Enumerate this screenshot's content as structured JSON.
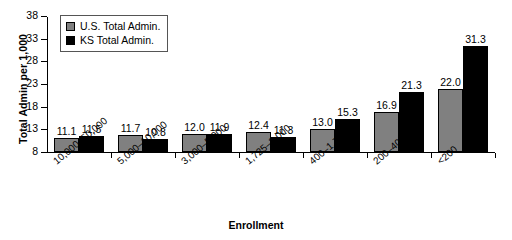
{
  "chart_data": {
    "type": "bar",
    "title": "",
    "xlabel": "Enrollment",
    "ylabel": "Total Admin per 1,000",
    "ylim": [
      8,
      38
    ],
    "yticks": [
      8,
      13,
      18,
      23,
      28,
      33,
      38
    ],
    "grid": false,
    "legend_position": "upper-left",
    "categories": [
      "10,000–50,000",
      "5,000–10,000",
      "3,000–5,000",
      "1,725–3,000",
      "400–1,725",
      "200–400",
      "<200"
    ],
    "series": [
      {
        "name": "U.S. Total Admin.",
        "color": "#808080",
        "values": [
          11.1,
          11.7,
          12.0,
          12.4,
          13.0,
          16.9,
          22.0
        ],
        "labels": [
          "11.1",
          "11.7",
          "12.0",
          "12.4",
          "13.0",
          "16.9",
          "22.0"
        ]
      },
      {
        "name": "KS Total Admin.",
        "color": "#000000",
        "values": [
          11.5,
          10.8,
          11.9,
          11.3,
          15.3,
          21.3,
          31.3
        ],
        "labels": [
          "11.5",
          "10.8",
          "11.9",
          "11.3",
          "15.3",
          "21.3",
          "31.3"
        ]
      }
    ]
  },
  "legend": {
    "items": [
      {
        "label": "U.S. Total Admin."
      },
      {
        "label": "KS Total Admin."
      }
    ]
  },
  "axes": {
    "y_title": "Total Admin per 1,000",
    "x_title": "Enrollment",
    "y_tick_labels": [
      "8",
      "13",
      "18",
      "23",
      "28",
      "33",
      "38"
    ]
  }
}
